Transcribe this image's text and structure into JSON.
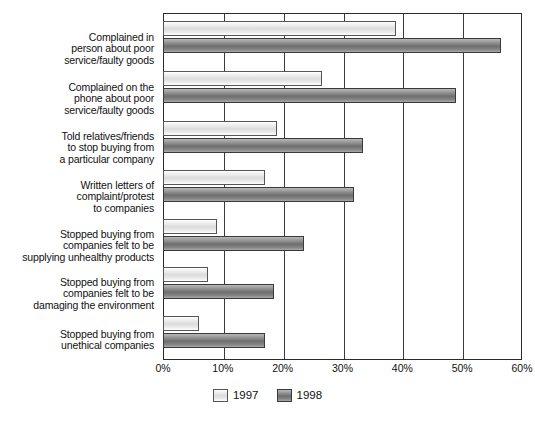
{
  "chart_data": {
    "type": "bar",
    "orientation": "horizontal",
    "title": "",
    "subtitle": "",
    "xlabel": "",
    "ylabel": "",
    "xlim": [
      0,
      60
    ],
    "xtick_labels": [
      "0%",
      "10%",
      "20%",
      "30%",
      "40%",
      "50%",
      "60%"
    ],
    "xtick_values": [
      0,
      10,
      20,
      30,
      40,
      50,
      60
    ],
    "grid": "vertical",
    "legend_position": "bottom-center",
    "categories": [
      "Complained in\nperson about poor\nservice/faulty goods",
      "Complained on the\nphone about poor\nservice/faulty goods",
      "Told relatives/friends\nto stop buying from\na particular company",
      "Written letters of\ncomplaint/protest\nto companies",
      "Stopped buying from\ncompanies felt to be\nsupplying unhealthy products",
      "Stopped buying from\ncompanies felt to be\ndamaging the environment",
      "Stopped buying from\nunethical companies"
    ],
    "category_lines": [
      [
        "Complained in",
        "person about poor",
        "service/faulty goods"
      ],
      [
        "Complained on the",
        "phone about poor",
        "service/faulty goods"
      ],
      [
        "Told relatives/friends",
        "to stop buying from",
        "a particular company"
      ],
      [
        "Written letters of",
        "complaint/protest",
        "to companies"
      ],
      [
        "Stopped buying from",
        "companies felt to be",
        "supplying unhealthy products"
      ],
      [
        "Stopped buying from",
        "companies felt to be",
        "damaging the environment"
      ],
      [
        "Stopped buying from",
        "unethical companies"
      ]
    ],
    "series": [
      {
        "name": "1997",
        "color": "#e8e8e8",
        "values": [
          39,
          26.5,
          19,
          17,
          9,
          7.5,
          6
        ]
      },
      {
        "name": "1998",
        "color": "#7a7a7a",
        "values": [
          56.5,
          49,
          33.5,
          32,
          23.5,
          18.5,
          17
        ]
      }
    ]
  },
  "legend": {
    "items": [
      {
        "label": "1997",
        "swatch": "s1997"
      },
      {
        "label": "1998",
        "swatch": "s1998"
      }
    ]
  }
}
